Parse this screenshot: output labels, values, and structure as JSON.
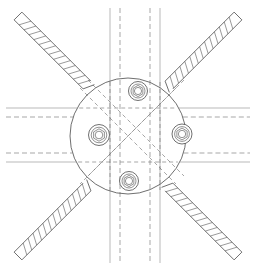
{
  "document": {
    "title": "Structural Connection Detail",
    "view_type": "plan-view",
    "drawing_kind": "engineering-line-drawing",
    "canvas": {
      "width": 256,
      "height": 271
    },
    "background_color": "#ffffff"
  },
  "style": {
    "line_color": "#4a4a4a",
    "line_color_light": "#8c8c8c",
    "hatch_color": "#555555",
    "dash_color": "#6b6b6b",
    "stroke_width_main": 0.8,
    "stroke_width_thin": 0.6,
    "dash_pattern": "5,3",
    "dash_pattern_fine": "4,3"
  },
  "geometry": {
    "center": {
      "x": 128,
      "y": 136
    },
    "gusset_plate": {
      "name": "circular-gusset-plate",
      "radius": 58,
      "stroke": "#4a4a4a"
    },
    "vertical_channel": {
      "name": "vertical-channel-section",
      "outer_left_x": 110,
      "outer_right_x": 160,
      "inner_left_x": 120,
      "inner_right_x": 150,
      "top_y": 8,
      "bottom_y": 263,
      "outer_style": "solid",
      "inner_style": "dashed"
    },
    "horizontal_channel": {
      "name": "horizontal-channel-section",
      "outer_top_y": 108,
      "outer_bottom_y": 162,
      "inner_top_y": 117,
      "inner_bottom_y": 153,
      "left_x": 6,
      "right_x": 250,
      "outer_style": "solid",
      "inner_style": "dashed"
    },
    "diagonal_braces": [
      {
        "name": "brace-upper-left",
        "angle_deg": 225,
        "outer_x": 18,
        "outer_y": 16,
        "inner_x": 87,
        "inner_y": 85,
        "width": 11,
        "hatch_count": 14
      },
      {
        "name": "brace-upper-right",
        "angle_deg": 315,
        "outer_x": 238,
        "outer_y": 16,
        "inner_x": 169,
        "inner_y": 85,
        "width": 11,
        "hatch_count": 14
      },
      {
        "name": "brace-lower-left",
        "angle_deg": 135,
        "outer_x": 18,
        "outer_y": 256,
        "inner_x": 87,
        "inner_y": 187,
        "width": 11,
        "hatch_count": 14
      },
      {
        "name": "brace-lower-right",
        "angle_deg": 45,
        "outer_x": 238,
        "outer_y": 256,
        "inner_x": 169,
        "inner_y": 187,
        "width": 11,
        "hatch_count": 14
      }
    ],
    "hidden_diagonals": [
      {
        "name": "hidden-diagonal-nw-se",
        "x1": 80,
        "y1": 88,
        "x2": 176,
        "y2": 184
      },
      {
        "name": "hidden-diagonal-ne-sw",
        "x1": 176,
        "y1": 88,
        "x2": 80,
        "y2": 184
      },
      {
        "name": "hidden-diagonal-nw-se-b",
        "x1": 88,
        "y1": 80,
        "x2": 184,
        "y2": 176
      },
      {
        "name": "hidden-diagonal-ne-sw-b",
        "x1": 184,
        "y1": 80,
        "x2": 88,
        "y2": 176
      }
    ],
    "bolts": [
      {
        "name": "bolt-north",
        "position": "north",
        "cx": 138,
        "cy": 91,
        "outer_r": 9.5,
        "mid_r": 7.0,
        "hex_r": 5.6,
        "inner_r": 3.6
      },
      {
        "name": "bolt-south",
        "position": "south",
        "cx": 129,
        "cy": 181,
        "outer_r": 9.5,
        "mid_r": 7.0,
        "hex_r": 5.6,
        "inner_r": 3.6
      },
      {
        "name": "bolt-west",
        "position": "west",
        "cx": 99,
        "cy": 135,
        "outer_r": 10.5,
        "mid_r": 7.8,
        "hex_r": 6.2,
        "inner_r": 3.8
      },
      {
        "name": "bolt-east",
        "position": "east",
        "cx": 182,
        "cy": 134,
        "outer_r": 10.0,
        "mid_r": 7.4,
        "hex_r": 5.9,
        "inner_r": 3.7
      }
    ]
  },
  "chart_data": {
    "type": "diagram",
    "title": "Structural Connection Detail",
    "component_count": 11,
    "components": [
      {
        "label": "Circular gusset plate",
        "quantity": 1
      },
      {
        "label": "Vertical channel section",
        "quantity": 1
      },
      {
        "label": "Horizontal channel section",
        "quantity": 1
      },
      {
        "label": "Diagonal brace (hatched)",
        "quantity": 4
      },
      {
        "label": "Bolt assembly",
        "quantity": 4
      }
    ],
    "line_types": [
      {
        "label": "Solid",
        "meaning": "visible edge"
      },
      {
        "label": "Dashed",
        "meaning": "hidden edge"
      },
      {
        "label": "Hatched",
        "meaning": "section cut"
      }
    ]
  }
}
